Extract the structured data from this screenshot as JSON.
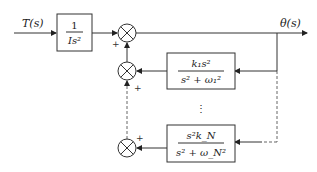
{
  "diagram": {
    "input_label": "T(s)",
    "output_label": "θ(s)",
    "plant_block": {
      "numerator": "1",
      "denominator": "Is²"
    },
    "feedback_blocks": [
      {
        "numerator": "k₁s²",
        "denominator": "s² + ω₁²"
      },
      {
        "numerator": "s²k_N",
        "denominator": "s² + ω_N²"
      }
    ],
    "ellipsis": "⋮",
    "signs": {
      "main_junction": "+",
      "junction_1": "+",
      "junction_n": "+"
    }
  }
}
